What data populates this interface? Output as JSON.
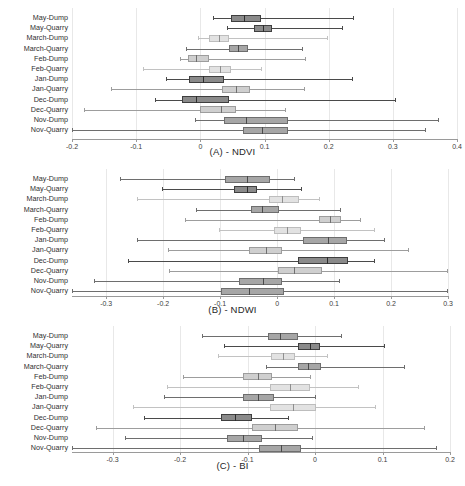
{
  "figure": {
    "categories": [
      "May-Dump",
      "May-Quarry",
      "March-Dump",
      "March-Quarry",
      "Feb-Dump",
      "Feb-Quarry",
      "Jan-Dump",
      "Jan-Quarry",
      "Dec-Dump",
      "Dec-Quarry",
      "Nov-Dump",
      "Nov-Quarry"
    ],
    "panel_captions": [
      "(A) - NDVI",
      "(B) - NDWI",
      "(C) - BI"
    ],
    "colors": {
      "dark": "#7d7d7d",
      "mid": "#9a9a9a",
      "light": "#c9c9c9",
      "pale": "#dcdcdc",
      "line_dark": "#4a4a4a",
      "line_light": "#b5b5b5",
      "grid": "#e8e8e8",
      "axis": "#9a9a9a",
      "text": "#2f2f2f"
    }
  },
  "chart_data": [
    {
      "type": "box",
      "title": "(A) - NDVI",
      "xlabel": "(A) - NDVI",
      "ylabel": "",
      "orientation": "horizontal",
      "grid": true,
      "legend": "none",
      "xlim": [
        -0.2,
        0.4
      ],
      "xticks": [
        -0.2,
        -0.1,
        0,
        0.1,
        0.2,
        0.3,
        0.4
      ],
      "xticklabels": [
        "-0.2",
        "-0.1",
        "0",
        "0.1",
        "0.2",
        "0.3",
        "0.4"
      ],
      "categories": [
        "May-Dump",
        "May-Quarry",
        "March-Dump",
        "March-Quarry",
        "Feb-Dump",
        "Feb-Quarry",
        "Jan-Dump",
        "Jan-Quarry",
        "Dec-Dump",
        "Dec-Quarry",
        "Nov-Dump",
        "Nov-Quarry"
      ],
      "boxes": [
        {
          "category": "May-Dump",
          "whislo": 0.019,
          "q1": 0.048,
          "med": 0.068,
          "q3": 0.095,
          "whishi": 0.24,
          "shade": "dark"
        },
        {
          "category": "May-Quarry",
          "whislo": 0.041,
          "q1": 0.083,
          "med": 0.097,
          "q3": 0.112,
          "whishi": 0.222,
          "shade": "dark"
        },
        {
          "category": "March-Dump",
          "whislo": -0.004,
          "q1": 0.014,
          "med": 0.029,
          "q3": 0.045,
          "whishi": 0.199,
          "shade": "pale"
        },
        {
          "category": "March-Quarry",
          "whislo": -0.022,
          "q1": 0.044,
          "med": 0.059,
          "q3": 0.074,
          "whishi": 0.16,
          "shade": "mid"
        },
        {
          "category": "Feb-Dump",
          "whislo": -0.032,
          "q1": -0.019,
          "med": -0.006,
          "q3": 0.014,
          "whishi": 0.165,
          "shade": "light"
        },
        {
          "category": "Feb-Quarry",
          "whislo": -0.089,
          "q1": 0.013,
          "med": 0.031,
          "q3": 0.048,
          "whishi": 0.096,
          "shade": "pale"
        },
        {
          "category": "Jan-Dump",
          "whislo": -0.053,
          "q1": -0.018,
          "med": 0.004,
          "q3": 0.037,
          "whishi": 0.238,
          "shade": "dark"
        },
        {
          "category": "Jan-Quarry",
          "whislo": -0.139,
          "q1": 0.034,
          "med": 0.055,
          "q3": 0.078,
          "whishi": 0.163,
          "shade": "light"
        },
        {
          "category": "Dec-Dump",
          "whislo": -0.071,
          "q1": -0.029,
          "med": -0.006,
          "q3": 0.045,
          "whishi": 0.305,
          "shade": "dark"
        },
        {
          "category": "Dec-Quarry",
          "whislo": -0.181,
          "q1": 0.0,
          "med": 0.032,
          "q3": 0.056,
          "whishi": 0.134,
          "shade": "light"
        },
        {
          "category": "Nov-Dump",
          "whislo": -0.009,
          "q1": 0.037,
          "med": 0.071,
          "q3": 0.137,
          "whishi": 0.372,
          "shade": "mid"
        },
        {
          "category": "Nov-Quarry",
          "whislo": -0.2,
          "q1": 0.066,
          "med": 0.096,
          "q3": 0.136,
          "whishi": 0.352,
          "shade": "mid"
        }
      ]
    },
    {
      "type": "box",
      "title": "(B) - NDWI",
      "xlabel": "(B) - NDWI",
      "ylabel": "",
      "orientation": "horizontal",
      "grid": true,
      "legend": "none",
      "xlim": [
        -0.36,
        0.3
      ],
      "xticks": [
        -0.3,
        -0.2,
        -0.1,
        0,
        0.1,
        0.2,
        0.3
      ],
      "xticklabels": [
        "-0.3",
        "-0.2",
        "-0.1",
        "0",
        "0.1",
        "0.2",
        "0.3"
      ],
      "categories": [
        "May-Dump",
        "May-Quarry",
        "March-Dump",
        "March-Quarry",
        "Feb-Dump",
        "Feb-Quarry",
        "Jan-Dump",
        "Jan-Quarry",
        "Dec-Dump",
        "Dec-Quarry",
        "Nov-Dump",
        "Nov-Quarry"
      ],
      "boxes": [
        {
          "category": "May-Dump",
          "whislo": -0.276,
          "q1": -0.091,
          "med": -0.052,
          "q3": -0.013,
          "whishi": 0.032,
          "shade": "mid"
        },
        {
          "category": "May-Quarry",
          "whislo": -0.202,
          "q1": -0.075,
          "med": -0.053,
          "q3": -0.036,
          "whishi": 0.043,
          "shade": "dark"
        },
        {
          "category": "March-Dump",
          "whislo": -0.246,
          "q1": -0.015,
          "med": 0.009,
          "q3": 0.038,
          "whishi": 0.076,
          "shade": "pale"
        },
        {
          "category": "March-Quarry",
          "whislo": -0.143,
          "q1": -0.045,
          "med": -0.027,
          "q3": 0.003,
          "whishi": 0.113,
          "shade": "mid"
        },
        {
          "category": "Feb-Dump",
          "whislo": -0.161,
          "q1": 0.073,
          "med": 0.093,
          "q3": 0.113,
          "whishi": 0.148,
          "shade": "light"
        },
        {
          "category": "Feb-Quarry",
          "whislo": -0.102,
          "q1": -0.006,
          "med": 0.018,
          "q3": 0.042,
          "whishi": 0.172,
          "shade": "pale"
        },
        {
          "category": "Jan-Dump",
          "whislo": -0.246,
          "q1": 0.046,
          "med": 0.09,
          "q3": 0.122,
          "whishi": 0.19,
          "shade": "mid"
        },
        {
          "category": "Jan-Quarry",
          "whislo": -0.191,
          "q1": -0.05,
          "med": -0.02,
          "q3": 0.009,
          "whishi": 0.231,
          "shade": "light"
        },
        {
          "category": "Dec-Dump",
          "whislo": -0.261,
          "q1": 0.036,
          "med": 0.088,
          "q3": 0.124,
          "whishi": 0.172,
          "shade": "dark"
        },
        {
          "category": "Dec-Quarry",
          "whislo": -0.19,
          "q1": 0.001,
          "med": 0.03,
          "q3": 0.079,
          "whishi": 0.3,
          "shade": "light"
        },
        {
          "category": "Nov-Dump",
          "whislo": -0.322,
          "q1": -0.066,
          "med": -0.025,
          "q3": 0.009,
          "whishi": 0.11,
          "shade": "mid"
        },
        {
          "category": "Nov-Quarry",
          "whislo": -0.36,
          "q1": -0.098,
          "med": -0.049,
          "q3": 0.013,
          "whishi": 0.3,
          "shade": "mid"
        }
      ]
    },
    {
      "type": "box",
      "title": "(C) - BI",
      "xlabel": "(C) - BI",
      "ylabel": "",
      "orientation": "horizontal",
      "grid": true,
      "legend": "none",
      "xlim": [
        -0.36,
        0.2
      ],
      "xticks": [
        -0.3,
        -0.2,
        -0.1,
        0,
        0.1,
        0.2
      ],
      "xticklabels": [
        "-0.3",
        "-0.2",
        "-0.1",
        "0",
        "0.1",
        "0.2"
      ],
      "categories": [
        "May-Dump",
        "May-Quarry",
        "March-Dump",
        "March-Quarry",
        "Feb-Dump",
        "Feb-Quarry",
        "Jan-Dump",
        "Jan-Quarry",
        "Dec-Dump",
        "Dec-Quarry",
        "Nov-Dump",
        "Nov-Quarry"
      ],
      "boxes": [
        {
          "category": "May-Dump",
          "whislo": -0.167,
          "q1": -0.069,
          "med": -0.052,
          "q3": -0.025,
          "whishi": 0.04,
          "shade": "mid"
        },
        {
          "category": "May-Quarry",
          "whislo": -0.135,
          "q1": -0.025,
          "med": -0.008,
          "q3": 0.008,
          "whishi": 0.104,
          "shade": "dark"
        },
        {
          "category": "March-Dump",
          "whislo": -0.144,
          "q1": -0.065,
          "med": -0.047,
          "q3": -0.03,
          "whishi": 0.02,
          "shade": "pale"
        },
        {
          "category": "March-Quarry",
          "whislo": -0.072,
          "q1": -0.025,
          "med": -0.011,
          "q3": 0.009,
          "whishi": 0.134,
          "shade": "mid"
        },
        {
          "category": "Feb-Dump",
          "whislo": -0.196,
          "q1": -0.107,
          "med": -0.085,
          "q3": -0.063,
          "whishi": -0.006,
          "shade": "light"
        },
        {
          "category": "Feb-Quarry",
          "whislo": -0.219,
          "q1": -0.066,
          "med": -0.037,
          "q3": -0.008,
          "whishi": 0.065,
          "shade": "pale"
        },
        {
          "category": "Jan-Dump",
          "whislo": -0.223,
          "q1": -0.107,
          "med": -0.085,
          "q3": -0.06,
          "whishi": 0.001,
          "shade": "mid"
        },
        {
          "category": "Jan-Quarry",
          "whislo": -0.27,
          "q1": -0.066,
          "med": -0.032,
          "q3": 0.001,
          "whishi": 0.091,
          "shade": "pale"
        },
        {
          "category": "Dec-Dump",
          "whislo": -0.253,
          "q1": -0.139,
          "med": -0.118,
          "q3": -0.094,
          "whishi": -0.038,
          "shade": "dark"
        },
        {
          "category": "Dec-Quarry",
          "whislo": -0.324,
          "q1": -0.093,
          "med": -0.059,
          "q3": -0.025,
          "whishi": 0.163,
          "shade": "light"
        },
        {
          "category": "Nov-Dump",
          "whislo": -0.281,
          "q1": -0.13,
          "med": -0.106,
          "q3": -0.079,
          "whishi": -0.003,
          "shade": "mid"
        },
        {
          "category": "Nov-Quarry",
          "whislo": -0.36,
          "q1": -0.083,
          "med": -0.05,
          "q3": -0.02,
          "whishi": 0.18,
          "shade": "mid"
        }
      ]
    }
  ]
}
